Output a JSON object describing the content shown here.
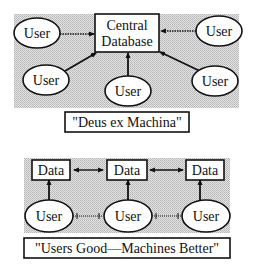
{
  "colors": {
    "background": "#ffffff",
    "shade": "#cfcfcf",
    "ink": "#111111"
  },
  "top_diagram": {
    "center_box": {
      "line1": "Central",
      "line2": "Database"
    },
    "users": [
      {
        "label": "User",
        "position": "top-left",
        "connector": "dotted"
      },
      {
        "label": "User",
        "position": "top-right",
        "connector": "dotted"
      },
      {
        "label": "User",
        "position": "bottom-left",
        "connector": "solid"
      },
      {
        "label": "User",
        "position": "bottom-center",
        "connector": "solid"
      },
      {
        "label": "User",
        "position": "bottom-right",
        "connector": "solid"
      }
    ],
    "caption": "\"Deus ex Machina\""
  },
  "bottom_diagram": {
    "data_boxes": [
      {
        "label": "Data"
      },
      {
        "label": "Data"
      },
      {
        "label": "Data"
      }
    ],
    "users": [
      {
        "label": "User"
      },
      {
        "label": "User"
      },
      {
        "label": "User"
      }
    ],
    "data_links": "bidirectional",
    "user_links": "dotted",
    "caption": "\"Users Good—Machines Better\""
  }
}
